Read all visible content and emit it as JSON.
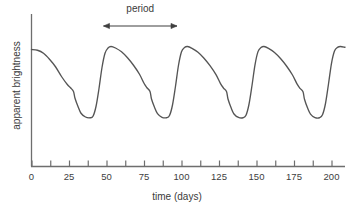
{
  "chart_data": {
    "type": "line",
    "title": "",
    "xlabel": "time (days)",
    "ylabel": "apparent brightness",
    "xlim": [
      0,
      210
    ],
    "ylim": [
      0,
      1
    ],
    "grid": false,
    "legend": null,
    "x_ticks_labeled": [
      0,
      25,
      50,
      75,
      100,
      125,
      150,
      175,
      200
    ],
    "x_tick_labels": [
      "0",
      "25",
      "50",
      "75",
      "100",
      "125",
      "150",
      "175",
      "200"
    ],
    "x_minor_tick_step": 12.5,
    "y_ticks_labeled": [],
    "y_tick_labels": [],
    "annotations": [
      {
        "name": "period",
        "text": "period",
        "type": "double-arrow",
        "x_start": 48,
        "x_end": 97,
        "value": 50,
        "units": "days"
      }
    ],
    "series": [
      {
        "name": "apparent brightness",
        "color": "#555555",
        "period_days": 50,
        "description": "Cepheid-type light curve: steep rise to maximum, slow asymmetric decline with a shoulder, then minimum.",
        "points": [
          [
            0,
            0.78
          ],
          [
            4,
            0.775
          ],
          [
            8,
            0.755
          ],
          [
            12,
            0.715
          ],
          [
            16,
            0.665
          ],
          [
            20,
            0.6
          ],
          [
            24,
            0.545
          ],
          [
            26,
            0.525
          ],
          [
            28,
            0.5
          ],
          [
            29,
            0.455
          ],
          [
            31,
            0.4
          ],
          [
            33,
            0.355
          ],
          [
            36,
            0.33
          ],
          [
            39,
            0.325
          ],
          [
            41,
            0.335
          ],
          [
            43,
            0.4
          ],
          [
            45,
            0.52
          ],
          [
            47,
            0.66
          ],
          [
            49,
            0.755
          ],
          [
            51,
            0.79
          ],
          [
            53,
            0.8
          ],
          [
            56,
            0.79
          ],
          [
            60,
            0.765
          ],
          [
            64,
            0.725
          ],
          [
            68,
            0.675
          ],
          [
            72,
            0.615
          ],
          [
            75,
            0.555
          ],
          [
            77,
            0.525
          ],
          [
            79,
            0.5
          ],
          [
            80,
            0.45
          ],
          [
            82,
            0.395
          ],
          [
            84,
            0.352
          ],
          [
            87,
            0.328
          ],
          [
            90,
            0.325
          ],
          [
            92,
            0.34
          ],
          [
            94,
            0.41
          ],
          [
            96,
            0.535
          ],
          [
            98,
            0.675
          ],
          [
            100,
            0.765
          ],
          [
            102,
            0.793
          ],
          [
            104,
            0.8
          ],
          [
            107,
            0.788
          ],
          [
            111,
            0.762
          ],
          [
            115,
            0.722
          ],
          [
            119,
            0.672
          ],
          [
            123,
            0.612
          ],
          [
            126,
            0.553
          ],
          [
            128,
            0.523
          ],
          [
            130,
            0.5
          ],
          [
            131,
            0.45
          ],
          [
            133,
            0.393
          ],
          [
            135,
            0.35
          ],
          [
            138,
            0.327
          ],
          [
            141,
            0.325
          ],
          [
            143,
            0.342
          ],
          [
            145,
            0.415
          ],
          [
            147,
            0.54
          ],
          [
            149,
            0.678
          ],
          [
            151,
            0.766
          ],
          [
            153,
            0.793
          ],
          [
            155,
            0.8
          ],
          [
            158,
            0.787
          ],
          [
            162,
            0.76
          ],
          [
            166,
            0.72
          ],
          [
            170,
            0.67
          ],
          [
            174,
            0.61
          ],
          [
            177,
            0.551
          ],
          [
            179,
            0.521
          ],
          [
            181,
            0.498
          ],
          [
            182,
            0.448
          ],
          [
            184,
            0.391
          ],
          [
            186,
            0.349
          ],
          [
            189,
            0.326
          ],
          [
            192,
            0.325
          ],
          [
            194,
            0.345
          ],
          [
            196,
            0.42
          ],
          [
            198,
            0.55
          ],
          [
            200,
            0.688
          ],
          [
            202,
            0.77
          ],
          [
            204,
            0.794
          ],
          [
            206,
            0.8
          ],
          [
            209,
            0.795
          ]
        ]
      }
    ]
  },
  "axes": {
    "x_axis_name": "time-axis",
    "y_axis_name": "brightness-axis"
  }
}
